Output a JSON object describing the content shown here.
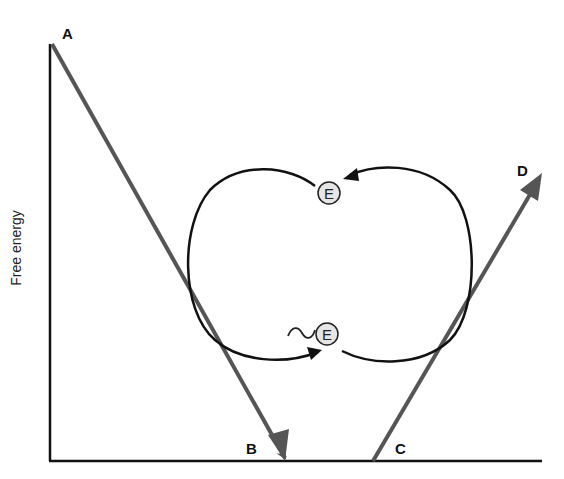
{
  "diagram": {
    "axis": {
      "ylabel": "Free energy"
    },
    "points": {
      "A": "A",
      "B": "B",
      "C": "C",
      "D": "D"
    },
    "enzyme": {
      "top_label": "E",
      "bottom_label": "E",
      "bottom_prefix": "~"
    },
    "colors": {
      "axis": "#111111",
      "reaction_arrow": "#555555",
      "cycle": "#111111",
      "enzyme_fill": "#e6e6e6"
    }
  }
}
